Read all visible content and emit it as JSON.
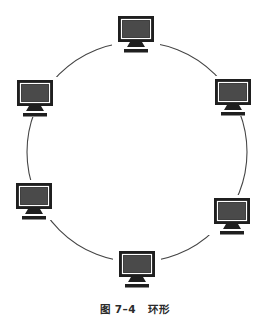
{
  "figure": {
    "caption_number": "图 7–4",
    "caption_title": "环形",
    "topology": "ring",
    "ring": {
      "cx": 137,
      "cy": 152,
      "r": 110,
      "stroke": "#444444",
      "stroke_width": 1.1
    },
    "node_icon": "computer-monitor-icon",
    "colors": {
      "frame": "#1f1f1f",
      "screen": "#4a4a4a",
      "bezel_gap": "#ffffff"
    },
    "nodes": [
      {
        "id": "node-top",
        "x": 136,
        "y": 31
      },
      {
        "id": "node-upper-right",
        "x": 233,
        "y": 94
      },
      {
        "id": "node-lower-right",
        "x": 232,
        "y": 213
      },
      {
        "id": "node-bottom",
        "x": 137,
        "y": 266
      },
      {
        "id": "node-lower-left",
        "x": 34,
        "y": 198
      },
      {
        "id": "node-upper-left",
        "x": 35,
        "y": 95
      }
    ]
  }
}
